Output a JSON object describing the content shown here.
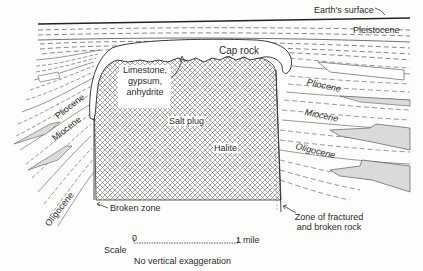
{
  "diagram": {
    "type": "geologic-cross-section",
    "labels": {
      "earth_surface": "Earth's surface",
      "pleistocene": "Pleistocene",
      "cap_rock": "Cap rock",
      "limestone": "Limestone,",
      "gypsum": "gypsum,",
      "anhydrite": "anhydrite",
      "salt_plug": "Salt plug",
      "halite": "Halite",
      "pliocene_left": "Pliocene",
      "miocene_left": "Miocene",
      "oligocene_left": "Oligocene",
      "pliocene_right": "Pliocene",
      "miocene_right": "Miocene",
      "oligocene_right": "Oligocene",
      "broken_zone": "Broken zone",
      "fractured_zone_1": "Zone of fractured",
      "fractured_zone_2": "and broken rock"
    },
    "scale": {
      "label": "Scale",
      "start": "0",
      "end": "1",
      "unit": "mile",
      "note": "No vertical exaggeration"
    },
    "colors": {
      "ink": "#2b2b2b",
      "hatch": "#6a6a6a",
      "stipple": "#c9c9c9",
      "paper": "#fdfdfb"
    }
  }
}
